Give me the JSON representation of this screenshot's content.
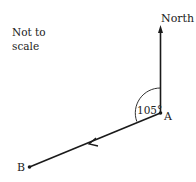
{
  "note": {
    "line1": "Not to",
    "line2": "scale"
  },
  "labels": {
    "north": "North",
    "point_a": "A",
    "point_b": "B",
    "angle": "105°"
  },
  "colors": {
    "ink": "#1a1a1a",
    "background": "#ffffff"
  }
}
